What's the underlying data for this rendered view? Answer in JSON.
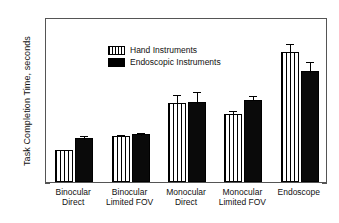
{
  "chart_data": {
    "type": "bar",
    "title": "",
    "subtitle": "",
    "xlabel": "",
    "ylabel": "Task Completion Time, seconds",
    "ylim": [
      0,
      25
    ],
    "ytick_labels": [
      "0",
      "5",
      "10",
      "15",
      "20",
      "25"
    ],
    "ytick_values": [
      0,
      5,
      10,
      15,
      20,
      25
    ],
    "yminor_step": 1,
    "grid": false,
    "legend_position": "upper-left inside axes",
    "categories": [
      "Binocular Direct",
      "Binocular Limited FOV",
      "Monocular Direct",
      "Monocular Limited FOV",
      "Endoscope"
    ],
    "category_lines": [
      [
        "Binocular",
        "Direct"
      ],
      [
        "Binocular",
        "Limited FOV"
      ],
      [
        "Monocular",
        "Direct"
      ],
      [
        "Monocular",
        "Limited FOV"
      ],
      [
        "Endoscope",
        ""
      ]
    ],
    "series": [
      {
        "name": "Hand Instruments",
        "fill": "vertical-hatch",
        "color": "#ffffff",
        "values": [
          4.9,
          6.9,
          12.0,
          10.3,
          19.7
        ],
        "errors_upper": [
          5.2,
          7.5,
          13.5,
          11.0,
          21.2
        ],
        "errors_lower": [
          4.6,
          6.3,
          10.5,
          9.6,
          18.2
        ]
      },
      {
        "name": "Endoscopic Instruments",
        "fill": "solid",
        "color": "#0a0a0a",
        "values": [
          6.7,
          7.3,
          12.1,
          12.5,
          16.8
        ],
        "errors_upper": [
          7.3,
          7.8,
          13.9,
          13.4,
          18.5
        ],
        "errors_lower": [
          6.1,
          6.8,
          10.3,
          11.6,
          15.1
        ]
      }
    ]
  },
  "legend": {
    "entries": [
      {
        "label": "Hand Instruments",
        "swatch": "hatched-bar-swatch"
      },
      {
        "label": "Endoscopic Instruments",
        "swatch": "solid-black-bar-swatch"
      }
    ]
  },
  "axes": {
    "y_title": "Task Completion Time, seconds",
    "y_ticks": [
      "25",
      "20",
      "15",
      "10",
      "5",
      "0"
    ]
  }
}
